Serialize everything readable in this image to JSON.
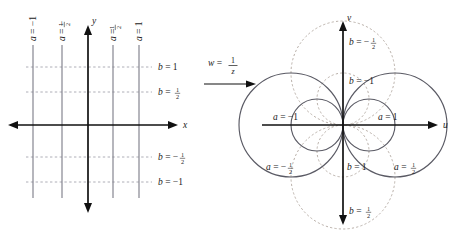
{
  "figure": {
    "colors": {
      "axis": "#111111",
      "grid_solid": "#6f6f7a",
      "grid_dashed": "#9a9aa4",
      "circle_solid": "#555560",
      "circle_dashed": "#b0a8a0",
      "text": "#1a1a1a",
      "background": "#ffffff"
    }
  },
  "transform": {
    "w_symbol": "w",
    "equals": "=",
    "numerator": "1",
    "denominator": "z",
    "arrow": "→"
  },
  "left_plane": {
    "name": "z-plane",
    "axes": {
      "x_label": "x",
      "y_label": "y"
    },
    "vertical_lines": [
      {
        "label_a": "a",
        "label_eq": "=",
        "value": "−1",
        "x": -1,
        "px": 33
      },
      {
        "label_a": "a",
        "label_eq": "=",
        "value_num": "1",
        "value_den": "2",
        "sign": "−",
        "x": -0.5,
        "px": 62
      },
      {
        "label_a": "a",
        "label_eq": "=",
        "value_num": "1",
        "value_den": "2",
        "sign": "",
        "x": 0.5,
        "px": 113
      },
      {
        "label_a": "a",
        "label_eq": "=",
        "value": "1",
        "x": 1,
        "px": 139
      }
    ],
    "horizontal_lines": [
      {
        "label": "b = 1",
        "b": 1,
        "py": 67
      },
      {
        "label": "b = 1/2",
        "b": 0.5,
        "py": 92
      },
      {
        "label": "b = -1/2",
        "b": -0.5,
        "py": 157
      },
      {
        "label": "b = -1",
        "b": -1,
        "py": 182
      }
    ]
  },
  "right_plane": {
    "name": "w-plane",
    "axes": {
      "u_label": "u",
      "v_label": "v"
    },
    "circles": [
      {
        "label": "a = -1",
        "type": "solid",
        "family": "a",
        "a": -1,
        "center_u": -0.5,
        "radius": 0.5
      },
      {
        "label": "a = -1/2",
        "type": "solid",
        "family": "a",
        "a": -0.5,
        "center_u": -1.0,
        "radius": 1.0
      },
      {
        "label": "a = 1",
        "type": "solid",
        "family": "a",
        "a": 1,
        "center_u": 0.5,
        "radius": 0.5
      },
      {
        "label": "a = 1/2",
        "type": "solid",
        "family": "a",
        "a": 0.5,
        "center_u": 1.0,
        "radius": 1.0
      },
      {
        "label": "b = -1",
        "type": "dashed",
        "family": "b",
        "b": -1,
        "center_v": 0.5,
        "radius": 0.5
      },
      {
        "label": "b = -1/2",
        "type": "dashed",
        "family": "b",
        "b": -0.5,
        "center_v": 1.0,
        "radius": 1.0
      },
      {
        "label": "b = 1",
        "type": "dashed",
        "family": "b",
        "b": 1,
        "center_v": -0.5,
        "radius": 0.5
      },
      {
        "label": "b = 1/2",
        "type": "dashed",
        "family": "b",
        "b": 0.5,
        "center_v": -1.0,
        "radius": 1.0
      }
    ],
    "labels": {
      "b_neg_half": {
        "lead": "b",
        "eq": "=",
        "sign": "−",
        "num": "1",
        "den": "2"
      },
      "b_neg_one": {
        "lead": "b",
        "eq": "=",
        "value": "−1"
      },
      "a_neg_one": {
        "lead": "a",
        "eq": "=",
        "value": "−1"
      },
      "a_one": {
        "lead": "a",
        "eq": "=",
        "value": "1"
      },
      "a_neg_half": {
        "lead": "a",
        "eq": "=",
        "sign": "−",
        "num": "1",
        "den": "2"
      },
      "a_half": {
        "lead": "a",
        "eq": "=",
        "sign": "",
        "num": "1",
        "den": "2"
      },
      "b_one": {
        "lead": "b",
        "eq": "=",
        "value": "1"
      },
      "b_half": {
        "lead": "b",
        "eq": "=",
        "sign": "",
        "num": "1",
        "den": "2"
      }
    }
  }
}
